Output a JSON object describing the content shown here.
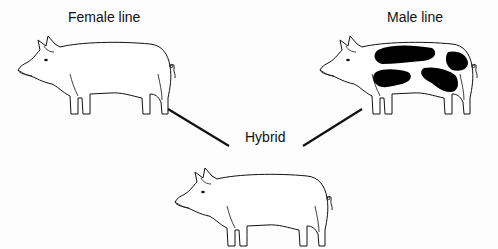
{
  "diagram": {
    "type": "breeding-cross",
    "nodes": [
      {
        "id": "female",
        "label": "Female line",
        "pattern": "plain"
      },
      {
        "id": "male",
        "label": "Male line",
        "pattern": "spotted"
      },
      {
        "id": "hybrid",
        "label": "Hybrid",
        "pattern": "plain"
      }
    ],
    "edges": [
      {
        "from": "female",
        "to": "hybrid"
      },
      {
        "from": "male",
        "to": "hybrid"
      }
    ]
  },
  "colors": {
    "line": "#111111",
    "spot": "#000000",
    "background": "#fdfdfd"
  }
}
